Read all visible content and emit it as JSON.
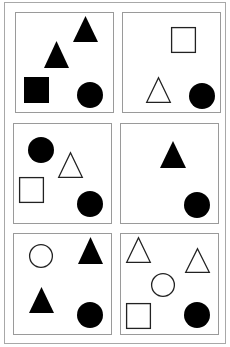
{
  "figure": {
    "colors": {
      "background": "#ffffff",
      "outer_border": "#a8a8a8",
      "panel_border": "#9a9a9a",
      "shape_fill": "#000000",
      "shape_stroke": "#222222"
    },
    "outer_frame": {
      "x": 4.5,
      "y": 2.5,
      "w": 221,
      "h": 341
    },
    "panels": [
      {
        "id": "panel-1",
        "row": 1,
        "col": 1,
        "x": 15.5,
        "y": 12.5,
        "w": 98,
        "h": 100,
        "shapes": [
          {
            "type": "triangle",
            "filled": true,
            "x": 73,
            "y": 16,
            "w": 25,
            "h": 26
          },
          {
            "type": "triangle",
            "filled": true,
            "x": 44,
            "y": 41,
            "w": 25,
            "h": 27
          },
          {
            "type": "square",
            "filled": true,
            "x": 24,
            "y": 77,
            "w": 25,
            "h": 26
          },
          {
            "type": "circle",
            "filled": true,
            "cx": 90,
            "cy": 95,
            "r": 13
          }
        ]
      },
      {
        "id": "panel-2",
        "row": 1,
        "col": 2,
        "x": 122.5,
        "y": 12.5,
        "w": 98,
        "h": 100,
        "shapes": [
          {
            "type": "square",
            "filled": false,
            "x": 171,
            "y": 27,
            "w": 25,
            "h": 26
          },
          {
            "type": "triangle",
            "filled": false,
            "x": 146,
            "y": 77,
            "w": 25,
            "h": 26
          },
          {
            "type": "circle",
            "filled": true,
            "cx": 202,
            "cy": 96,
            "r": 13
          }
        ]
      },
      {
        "id": "panel-3",
        "row": 2,
        "col": 1,
        "x": 13.5,
        "y": 123.5,
        "w": 98,
        "h": 100,
        "shapes": [
          {
            "type": "circle",
            "filled": true,
            "cx": 41,
            "cy": 150,
            "r": 13
          },
          {
            "type": "triangle",
            "filled": false,
            "x": 58,
            "y": 152,
            "w": 25,
            "h": 26
          },
          {
            "type": "square",
            "filled": false,
            "x": 19,
            "y": 177,
            "w": 25,
            "h": 26
          },
          {
            "type": "circle",
            "filled": true,
            "cx": 90,
            "cy": 204,
            "r": 13
          }
        ]
      },
      {
        "id": "panel-4",
        "row": 2,
        "col": 2,
        "x": 120.5,
        "y": 123.5,
        "w": 98,
        "h": 100,
        "shapes": [
          {
            "type": "triangle",
            "filled": true,
            "x": 160,
            "y": 141,
            "w": 26,
            "h": 27
          },
          {
            "type": "circle",
            "filled": true,
            "cx": 197,
            "cy": 205,
            "r": 13
          }
        ]
      },
      {
        "id": "panel-5",
        "row": 3,
        "col": 1,
        "x": 13.5,
        "y": 233.5,
        "w": 98,
        "h": 101,
        "shapes": [
          {
            "type": "circle",
            "filled": false,
            "cx": 41,
            "cy": 256,
            "r": 12
          },
          {
            "type": "triangle",
            "filled": true,
            "x": 78,
            "y": 237,
            "w": 25,
            "h": 27
          },
          {
            "type": "triangle",
            "filled": true,
            "x": 29,
            "y": 287,
            "w": 25,
            "h": 26
          },
          {
            "type": "circle",
            "filled": true,
            "cx": 90,
            "cy": 315,
            "r": 13
          }
        ]
      },
      {
        "id": "panel-6",
        "row": 3,
        "col": 2,
        "x": 120.5,
        "y": 233.5,
        "w": 98,
        "h": 101,
        "shapes": [
          {
            "type": "triangle",
            "filled": false,
            "x": 126,
            "y": 237,
            "w": 25,
            "h": 26
          },
          {
            "type": "triangle",
            "filled": false,
            "x": 185,
            "y": 248,
            "w": 25,
            "h": 25
          },
          {
            "type": "circle",
            "filled": false,
            "cx": 163,
            "cy": 285,
            "r": 12
          },
          {
            "type": "square",
            "filled": false,
            "x": 126,
            "y": 303,
            "w": 25,
            "h": 26
          },
          {
            "type": "circle",
            "filled": true,
            "cx": 197,
            "cy": 315,
            "r": 13
          }
        ]
      }
    ]
  }
}
